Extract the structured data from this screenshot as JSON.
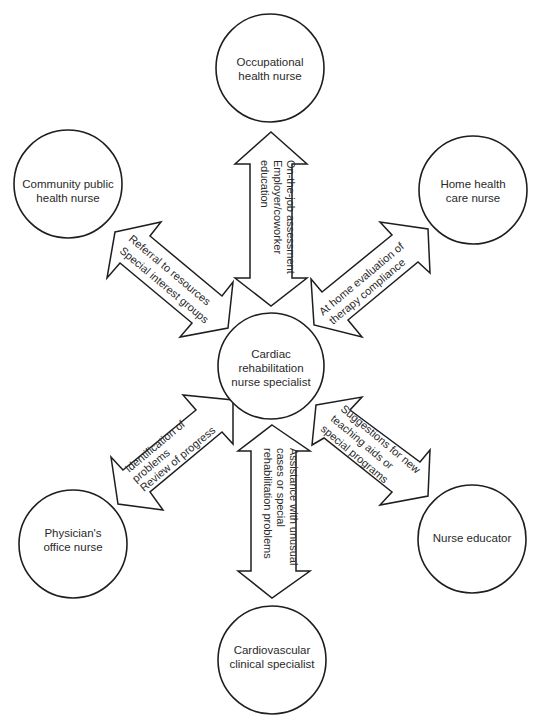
{
  "diagram": {
    "type": "hub-and-spoke",
    "center": {
      "id": "cardiac-rehab",
      "lines": [
        "Cardiac",
        "rehabilitation",
        "nurse specialist"
      ]
    },
    "nodes": [
      {
        "id": "occupational",
        "lines": [
          "Occupational",
          "health nurse"
        ]
      },
      {
        "id": "community",
        "lines": [
          "Community public",
          "health nurse"
        ]
      },
      {
        "id": "home-health",
        "lines": [
          "Home health",
          "care nurse"
        ]
      },
      {
        "id": "physician-office",
        "lines": [
          "Physician's",
          "office nurse"
        ]
      },
      {
        "id": "nurse-educator",
        "lines": [
          "Nurse educator"
        ]
      },
      {
        "id": "cardiovascular",
        "lines": [
          "Cardiovascular",
          "clinical specialist"
        ]
      }
    ],
    "edges": [
      {
        "from": "cardiac-rehab",
        "to": "occupational",
        "direction": "bidirectional",
        "lines": [
          "On-the-job assessment",
          "Employer/coworker",
          "education"
        ]
      },
      {
        "from": "cardiac-rehab",
        "to": "community",
        "direction": "bidirectional",
        "lines": [
          "Referral to resources",
          "Special interest groups"
        ]
      },
      {
        "from": "cardiac-rehab",
        "to": "home-health",
        "direction": "bidirectional",
        "lines": [
          "At home evaluation of",
          "therapy compliance"
        ]
      },
      {
        "from": "cardiac-rehab",
        "to": "physician-office",
        "direction": "bidirectional",
        "lines": [
          "Identification of",
          "problems",
          "Review of progress"
        ]
      },
      {
        "from": "cardiac-rehab",
        "to": "nurse-educator",
        "direction": "bidirectional",
        "lines": [
          "Suggestions for new",
          "teaching aids or",
          "special programs"
        ]
      },
      {
        "from": "cardiac-rehab",
        "to": "cardiovascular",
        "direction": "bidirectional",
        "lines": [
          "Assistance with unusual",
          "cases or special",
          "rehabilitation problems"
        ]
      }
    ]
  },
  "colors": {
    "stroke": "#1e1e1e",
    "fill": "#ffffff",
    "text": "#2a2a2a"
  }
}
